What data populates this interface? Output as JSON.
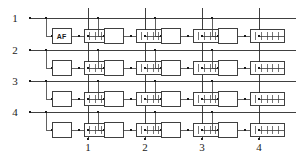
{
  "figure": {
    "kind": "memory-cell-array-schematic",
    "rows": 4,
    "columns": 4,
    "row_labels": [
      "1",
      "2",
      "3",
      "4"
    ],
    "column_labels": [
      "1",
      "2",
      "3",
      "4"
    ],
    "row_line_y": [
      18,
      50,
      81,
      112
    ],
    "column_line_x": [
      88,
      145,
      202,
      259
    ],
    "row_label_x": 15,
    "column_label_y": 151,
    "line_start_x": 30,
    "line_end_x": 296,
    "column_line_top_y": 8,
    "column_line_bottom_y": 139,
    "cell": {
      "branch_drop": 18,
      "switch_box": {
        "width": 19,
        "height": 15
      },
      "element_box": {
        "width": 34,
        "height": 13,
        "hatch_count": 5
      }
    },
    "annotated_cell": {
      "row": 1,
      "column": 1,
      "label": "AF"
    },
    "colors": {
      "ink": "#2b2b2b",
      "ink_light": "#3a3a3a",
      "node": "#1a1a1a",
      "background": "#ffffff"
    }
  }
}
